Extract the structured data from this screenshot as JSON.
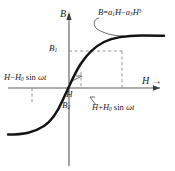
{
  "figure": {
    "axes": {
      "y_label": "B",
      "x_label": "H",
      "y_arrow": "↑",
      "x_arrow": "→"
    },
    "labels": {
      "b1": "B",
      "b1_sub": "1",
      "b2": "B",
      "b2_sub": "2",
      "h_point": "H",
      "equation_lhs": "B",
      "equation_eq": "=",
      "equation_a1": "a",
      "equation_a1_sub": "1",
      "equation_h1": "H",
      "equation_minus": "−",
      "equation_a3": "a",
      "equation_a3_sub": "3",
      "equation_h3": "H",
      "equation_h3_sup": "3",
      "left_mod_h": "H",
      "left_mod_minus": "−",
      "left_mod_h0": "H",
      "left_mod_h0_sub": "0",
      "left_mod_sin": "sin",
      "left_mod_omega": "ωt",
      "right_mod_h": "H",
      "right_mod_plus": "+",
      "right_mod_h0": "H",
      "right_mod_h0_sub": "0",
      "right_mod_sin": "sin",
      "right_mod_omega": "ωt"
    },
    "colors": {
      "curve": "#111111",
      "axis": "#555555",
      "dashed": "#777777",
      "background": "#ffffff"
    }
  },
  "chart_data": {
    "type": "line",
    "title": "",
    "xlabel": "H",
    "ylabel": "B",
    "equation": "B = a1*H - a3*H^3",
    "grid": false,
    "legend": "none",
    "xlim": [
      -1,
      1
    ],
    "ylim": [
      -1,
      1
    ],
    "operating_point": {
      "x_label": "H",
      "y_label": "B1",
      "x": 0.02,
      "y": 0.3
    },
    "markers": [
      {
        "name": "B1",
        "axis": "y",
        "value": 0.52,
        "dashed": true
      },
      {
        "name": "B2",
        "axis": "y",
        "value": -0.18,
        "dashed": false
      },
      {
        "name": "H",
        "axis": "x",
        "value": 0.02,
        "dashed": true
      },
      {
        "name": "H + H0 sin wt",
        "axis": "x",
        "value": 0.38,
        "dashed": true
      },
      {
        "name": "H - H0 sin wt",
        "axis": "x",
        "value": -0.32,
        "dashed": true
      }
    ],
    "series": [
      {
        "name": "B(H)",
        "x": [
          -1.0,
          -0.9,
          -0.8,
          -0.7,
          -0.6,
          -0.5,
          -0.4,
          -0.3,
          -0.2,
          -0.1,
          0.0,
          0.1,
          0.2,
          0.3,
          0.4,
          0.5,
          0.6,
          0.7,
          0.8,
          0.9,
          1.0
        ],
        "y": [
          -0.76,
          -0.76,
          -0.75,
          -0.73,
          -0.7,
          -0.65,
          -0.57,
          -0.45,
          -0.3,
          -0.15,
          0.0,
          0.18,
          0.36,
          0.52,
          0.63,
          0.7,
          0.74,
          0.76,
          0.77,
          0.78,
          0.78
        ]
      }
    ]
  }
}
